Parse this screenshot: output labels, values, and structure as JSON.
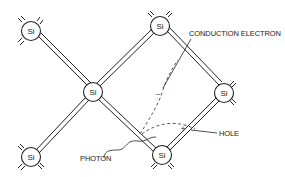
{
  "diagram": {
    "title": "",
    "colors": {
      "ink": "#222222",
      "background": "#ffffff"
    },
    "atoms": [
      {
        "id": "si-top-left",
        "label": "Si",
        "x": 31,
        "y": 31
      },
      {
        "id": "si-bottom-left",
        "label": "Si",
        "x": 31,
        "y": 157
      },
      {
        "id": "si-center",
        "label": "Si",
        "x": 93,
        "y": 92
      },
      {
        "id": "si-top-center",
        "label": "Si",
        "x": 160,
        "y": 26
      },
      {
        "id": "si-right",
        "label": "Si",
        "x": 224,
        "y": 93
      },
      {
        "id": "si-bottom-center",
        "label": "Si",
        "x": 162,
        "y": 155
      }
    ],
    "bonds": [
      {
        "from": "si-top-left",
        "to": "si-center"
      },
      {
        "from": "si-bottom-left",
        "to": "si-center"
      },
      {
        "from": "si-center",
        "to": "si-top-center"
      },
      {
        "from": "si-center",
        "to": "si-bottom-center"
      },
      {
        "from": "si-top-center",
        "to": "si-right"
      },
      {
        "from": "si-right",
        "to": "si-bottom-center"
      }
    ],
    "labels": {
      "conduction_electron": "CONDUCTION ELECTRON",
      "hole": "HOLE",
      "photon": "PHOTON",
      "electron_sign": "–",
      "hole_sign": "+"
    }
  }
}
